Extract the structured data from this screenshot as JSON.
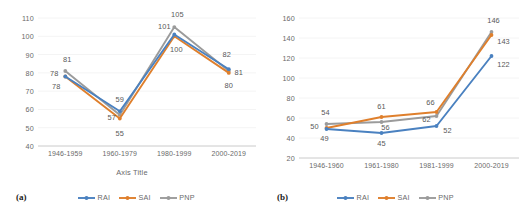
{
  "figure": {
    "panels": [
      {
        "tag": "(a)",
        "axis_title": "Axis Title",
        "legend": [
          {
            "name": "RAI",
            "color": "#4a81c0"
          },
          {
            "name": "SAI",
            "color": "#df7f2c"
          },
          {
            "name": "PNP",
            "color": "#9b9b9b"
          }
        ],
        "chart_data": {
          "type": "line",
          "title": "",
          "xlabel": "Axis Title",
          "ylabel": "",
          "categories": [
            "1946-1959",
            "1960-1979",
            "1980-1999",
            "2000-2019"
          ],
          "series": [
            {
              "name": "RAI",
              "color": "#4a81c0",
              "values": [
                78,
                59,
                101,
                82
              ]
            },
            {
              "name": "SAI",
              "color": "#df7f2c",
              "values": [
                78,
                55,
                100,
                80
              ]
            },
            {
              "name": "PNP",
              "color": "#9b9b9b",
              "values": [
                81,
                57,
                105,
                81
              ]
            }
          ],
          "ylim": [
            40,
            110
          ],
          "ytick_step": 10,
          "yticks": [
            40,
            50,
            60,
            70,
            80,
            90,
            100,
            110
          ],
          "grid": false,
          "legend_position": "bottom",
          "data_labels": true
        }
      },
      {
        "tag": "(b)",
        "axis_title": "",
        "legend": [
          {
            "name": "RAI",
            "color": "#4a81c0"
          },
          {
            "name": "SAI",
            "color": "#df7f2c"
          },
          {
            "name": "PNP",
            "color": "#9b9b9b"
          }
        ],
        "chart_data": {
          "type": "line",
          "title": "",
          "xlabel": "",
          "ylabel": "",
          "categories": [
            "1946-1960",
            "1961-1980",
            "1981-1999",
            "2000-2019"
          ],
          "series": [
            {
              "name": "RAI",
              "color": "#4a81c0",
              "values": [
                49,
                45,
                52,
                122
              ]
            },
            {
              "name": "SAI",
              "color": "#df7f2c",
              "values": [
                50,
                61,
                66,
                143
              ]
            },
            {
              "name": "PNP",
              "color": "#9b9b9b",
              "values": [
                54,
                56,
                62,
                146
              ]
            }
          ],
          "ylim": [
            20,
            160
          ],
          "ytick_step": 20,
          "yticks": [
            20,
            40,
            60,
            80,
            100,
            120,
            140,
            160
          ],
          "grid": false,
          "legend_position": "bottom",
          "data_labels": true
        }
      }
    ]
  }
}
